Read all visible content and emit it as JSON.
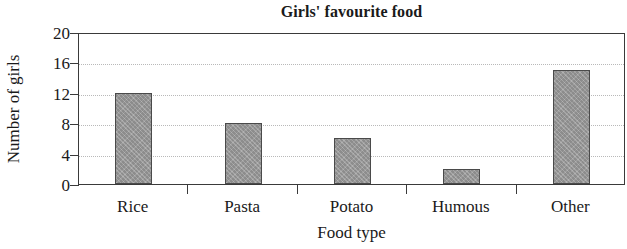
{
  "chart_data": {
    "type": "bar",
    "title": "Girls' favourite food",
    "xlabel": "Food type",
    "ylabel": "Number of girls",
    "categories": [
      "Rice",
      "Pasta",
      "Potato",
      "Humous",
      "Other"
    ],
    "values": [
      12,
      8,
      6,
      2,
      15
    ],
    "ylim": [
      0,
      20
    ],
    "yticks": [
      0,
      4,
      8,
      12,
      16,
      20
    ],
    "ytick_labels": [
      "0",
      "4",
      "8",
      "12",
      "16",
      "20"
    ],
    "grid": true,
    "legend": false,
    "bar_color": "#9a9a9a",
    "bar_edge_color": "#4a4a4a",
    "axis_color": "#3a3a3a",
    "grid_color": "#b9b9b9",
    "background_color": "#ffffff"
  }
}
